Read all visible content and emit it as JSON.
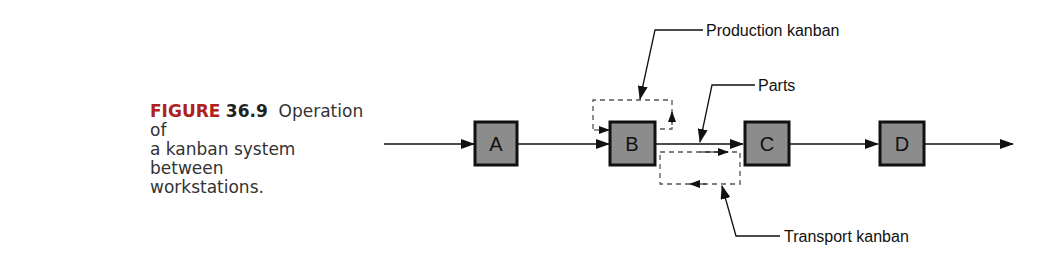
{
  "caption": {
    "figure_label": "FIGURE",
    "figure_number": "36.9",
    "text_line1": "Operation of",
    "text_line2": "a kanban system between",
    "text_line3": "workstations."
  },
  "diagram": {
    "stations": [
      {
        "id": "A",
        "label": "A"
      },
      {
        "id": "B",
        "label": "B"
      },
      {
        "id": "C",
        "label": "C"
      },
      {
        "id": "D",
        "label": "D"
      }
    ],
    "annotations": {
      "production_kanban": "Production kanban",
      "parts": "Parts",
      "transport_kanban": "Transport kanban"
    },
    "colors": {
      "box_fill": "#8c8c8c",
      "line": "#111111",
      "dashed": "#555555",
      "figure_label": "#b0201c"
    }
  }
}
